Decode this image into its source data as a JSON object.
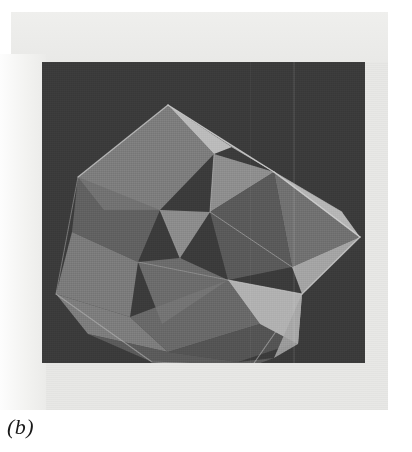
{
  "figure": {
    "caption": "(b)",
    "plate_background_color": "#3b3b3b",
    "paper_color": "#e8e8e6",
    "page_color": "#ffffff"
  },
  "ghost_text": {
    "top_line_1": "                  ",
    "top_line_2": "                       ",
    "bottom_line_1": "                              ",
    "bottom_line_2": "                              ",
    "right_margin": "     "
  },
  "geometry": {
    "plate": {
      "x": 42,
      "y": 62,
      "width": 323,
      "height": 301
    },
    "facet_palette": {
      "brightest": "#c4c4c4",
      "bright": "#b0b0b0",
      "mid_bright": "#9a9a9a",
      "mid": "#858585",
      "mid_dark": "#6e6e6e",
      "dark": "#5c5c5c",
      "darkest": "#4c4c4c"
    },
    "facets": [
      {
        "name": "upper-left-large-panel",
        "points": "36,115 126,43 172,92 118,148 62,148",
        "fill": "#8a8a8a",
        "opacity": 0.85
      },
      {
        "name": "top-ridge-bright",
        "points": "126,43 190,85 172,92",
        "fill": "#c2c2c2",
        "opacity": 0.95
      },
      {
        "name": "top-right-upper-face",
        "points": "126,43 232,110 190,85",
        "fill": "#a8a8a8",
        "opacity": 0.9
      },
      {
        "name": "upper-mid-triangle",
        "points": "172,92 232,110 168,150",
        "fill": "#9d9d9d",
        "opacity": 0.85
      },
      {
        "name": "right-upper-wing",
        "points": "190,85 300,150 232,110",
        "fill": "#b5b5b5",
        "opacity": 0.9
      },
      {
        "name": "right-tip-face",
        "points": "232,110 318,175 300,150",
        "fill": "#bdbdbd",
        "opacity": 0.95
      },
      {
        "name": "right-lower-wing",
        "points": "232,110 318,175 250,205",
        "fill": "#7f7f7f",
        "opacity": 0.8
      },
      {
        "name": "right-tip-under",
        "points": "318,175 260,232 250,205",
        "fill": "#b0b0b0",
        "opacity": 0.9
      },
      {
        "name": "center-dark-quad",
        "points": "168,150 232,110 250,205 186,218",
        "fill": "#636363",
        "opacity": 0.8
      },
      {
        "name": "left-mid-facet",
        "points": "36,115 118,148 96,200 30,170",
        "fill": "#6f6f6f",
        "opacity": 0.75
      },
      {
        "name": "left-lower-facet",
        "points": "30,170 96,200 88,255 14,232",
        "fill": "#8c8c8c",
        "opacity": 0.8
      },
      {
        "name": "inner-left-triangle",
        "points": "118,148 168,150 138,196",
        "fill": "#9b9b9b",
        "opacity": 0.85
      },
      {
        "name": "mid-left-shadow",
        "points": "96,200 138,196 186,218 120,262",
        "fill": "#7a7a7a",
        "opacity": 0.78
      },
      {
        "name": "bottom-left-panel",
        "points": "14,232 88,255 126,290 46,272",
        "fill": "#8f8f8f",
        "opacity": 0.8
      },
      {
        "name": "bottom-center-panel",
        "points": "88,255 186,218 218,262 126,290",
        "fill": "#767676",
        "opacity": 0.78
      },
      {
        "name": "bottom-center-dark",
        "points": "126,290 218,262 256,280 196,300",
        "fill": "#5e5e5e",
        "opacity": 0.75
      },
      {
        "name": "bottom-right-bright-wedge",
        "points": "186,218 260,232 256,282 218,262",
        "fill": "#bcbcbc",
        "opacity": 0.92
      },
      {
        "name": "bottom-right-taper",
        "points": "260,232 256,282 232,296",
        "fill": "#a5a5a5",
        "opacity": 0.88
      },
      {
        "name": "lower-skirt",
        "points": "46,272 126,290 196,300 232,296 210,304 110,300",
        "fill": "#6a6a6a",
        "opacity": 0.7
      }
    ],
    "edges": [
      {
        "name": "edge-top-apex-left",
        "d": "M126,43 L36,115",
        "stroke": "#d0d0d0",
        "width": 1.3,
        "opacity": 0.75
      },
      {
        "name": "edge-top-apex-right",
        "d": "M126,43 L232,110",
        "stroke": "#d8d8d8",
        "width": 1.4,
        "opacity": 0.8
      },
      {
        "name": "edge-right-tip-upper",
        "d": "M232,110 L318,175",
        "stroke": "#d8d8d8",
        "width": 1.5,
        "opacity": 0.85
      },
      {
        "name": "edge-right-tip-lower",
        "d": "M318,175 L260,232",
        "stroke": "#cfcfcf",
        "width": 1.3,
        "opacity": 0.8
      },
      {
        "name": "edge-left-outer",
        "d": "M36,115 L14,232",
        "stroke": "#a8a8a8",
        "width": 1.0,
        "opacity": 0.55
      },
      {
        "name": "edge-bottom-outer",
        "d": "M14,232 L110,300 L210,304 L260,232",
        "stroke": "#b4b4b4",
        "width": 1.1,
        "opacity": 0.6
      },
      {
        "name": "edge-inner-diag-1",
        "d": "M172,92 L168,150",
        "stroke": "#c0c0c0",
        "width": 1.0,
        "opacity": 0.6
      },
      {
        "name": "edge-inner-diag-2",
        "d": "M168,150 L250,205",
        "stroke": "#b8b8b8",
        "width": 1.0,
        "opacity": 0.55
      },
      {
        "name": "edge-inner-diag-3",
        "d": "M186,218 L260,232",
        "stroke": "#cccccc",
        "width": 1.2,
        "opacity": 0.7
      },
      {
        "name": "edge-inner-diag-4",
        "d": "M96,200 L186,218",
        "stroke": "#b0b0b0",
        "width": 0.9,
        "opacity": 0.5
      },
      {
        "name": "edge-inner-diag-5",
        "d": "M118,148 L138,196",
        "stroke": "#b0b0b0",
        "width": 0.9,
        "opacity": 0.5
      },
      {
        "name": "edge-inner-diag-6",
        "d": "M190,85 L300,150",
        "stroke": "#c8c8c8",
        "width": 1.0,
        "opacity": 0.55
      }
    ]
  }
}
